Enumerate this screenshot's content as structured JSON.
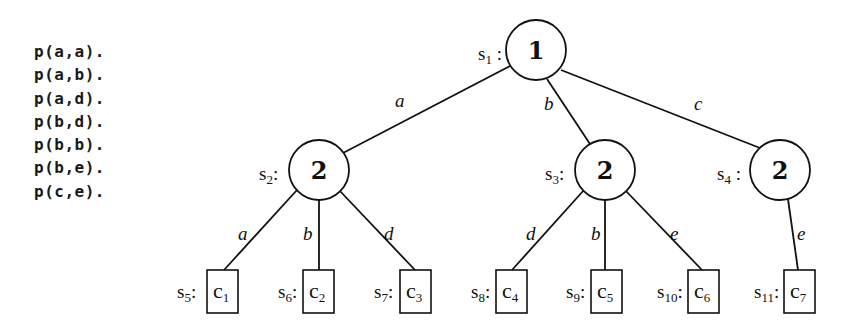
{
  "facts": [
    "p(a,a).",
    "p(a,b).",
    "p(a,d).",
    "p(b,d).",
    "p(b,b).",
    "p(b,e).",
    "p(c,e)."
  ],
  "tree": {
    "root": {
      "state": "s",
      "state_sub": "1",
      "value": "1"
    },
    "level1": [
      {
        "state": "s",
        "state_sub": "2",
        "value": "2",
        "edge_label": "a"
      },
      {
        "state": "s",
        "state_sub": "3",
        "value": "2",
        "edge_label": "b"
      },
      {
        "state": "s",
        "state_sub": "4",
        "value": "2",
        "edge_label": "c"
      }
    ],
    "leaves": [
      {
        "state": "s",
        "state_sub": "5",
        "label": "c",
        "label_sub": "1",
        "edge_label": "a",
        "parent": "s2"
      },
      {
        "state": "s",
        "state_sub": "6",
        "label": "c",
        "label_sub": "2",
        "edge_label": "b",
        "parent": "s2"
      },
      {
        "state": "s",
        "state_sub": "7",
        "label": "c",
        "label_sub": "3",
        "edge_label": "d",
        "parent": "s2"
      },
      {
        "state": "s",
        "state_sub": "8",
        "label": "c",
        "label_sub": "4",
        "edge_label": "d",
        "parent": "s3"
      },
      {
        "state": "s",
        "state_sub": "9",
        "label": "c",
        "label_sub": "5",
        "edge_label": "b",
        "parent": "s3"
      },
      {
        "state": "s",
        "state_sub": "10",
        "label": "c",
        "label_sub": "6",
        "edge_label": "e",
        "parent": "s3"
      },
      {
        "state": "s",
        "state_sub": "11",
        "label": "c",
        "label_sub": "7",
        "edge_label": "e",
        "parent": "s4"
      }
    ]
  }
}
